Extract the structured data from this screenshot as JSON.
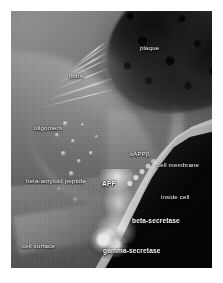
{
  "figure": {
    "kind": "scientific-illustration",
    "color_mode": "grayscale",
    "border_color": "#ffffff",
    "label_color": "#f4f4f4",
    "labels": [
      {
        "id": "plaque",
        "text": "plaque",
        "x": 140,
        "y": 44,
        "bold": false
      },
      {
        "id": "fibrils",
        "text": "fibrils",
        "x": 69,
        "y": 72,
        "bold": false
      },
      {
        "id": "oligomers",
        "text": "oligomers",
        "x": 34,
        "y": 124,
        "bold": false
      },
      {
        "id": "sappb",
        "text": "sAPPβ",
        "x": 130,
        "y": 150,
        "bold": false
      },
      {
        "id": "cell-membrane",
        "text": "cell membrane",
        "x": 157,
        "y": 161,
        "bold": false
      },
      {
        "id": "beta-amyloid-peptide",
        "text": "beta-amyloid peptide",
        "x": 26,
        "y": 177,
        "bold": false
      },
      {
        "id": "app",
        "text": "APP",
        "x": 102,
        "y": 180,
        "bold": true
      },
      {
        "id": "inside-cell",
        "text": "inside cell",
        "x": 161,
        "y": 193,
        "bold": false
      },
      {
        "id": "beta-secretase",
        "text": "beta-secretase",
        "x": 132,
        "y": 217,
        "bold": true
      },
      {
        "id": "cell-surface",
        "text": "cell surface",
        "x": 22,
        "y": 242,
        "bold": false
      },
      {
        "id": "gamma-secretase",
        "text": "gamma-secretase",
        "x": 103,
        "y": 247,
        "bold": true
      }
    ],
    "fibril_strands": [
      {
        "left": 36,
        "top": 88,
        "width": 68,
        "rotate": -18
      },
      {
        "left": 40,
        "top": 80,
        "width": 62,
        "rotate": -22
      },
      {
        "left": 46,
        "top": 72,
        "width": 56,
        "rotate": -26
      },
      {
        "left": 52,
        "top": 66,
        "width": 50,
        "rotate": -30
      },
      {
        "left": 58,
        "top": 60,
        "width": 44,
        "rotate": -34
      },
      {
        "left": 30,
        "top": 96,
        "width": 74,
        "rotate": -14
      },
      {
        "left": 64,
        "top": 54,
        "width": 38,
        "rotate": -38
      }
    ],
    "oligomer_blobs": [
      {
        "left": 52,
        "top": 110,
        "size": 5
      },
      {
        "left": 44,
        "top": 122,
        "size": 4
      },
      {
        "left": 60,
        "top": 128,
        "size": 4
      },
      {
        "left": 50,
        "top": 140,
        "size": 5
      },
      {
        "left": 66,
        "top": 148,
        "size": 4
      },
      {
        "left": 58,
        "top": 160,
        "size": 5
      },
      {
        "left": 72,
        "top": 170,
        "size": 4
      },
      {
        "left": 46,
        "top": 176,
        "size": 4
      },
      {
        "left": 62,
        "top": 186,
        "size": 5
      },
      {
        "left": 78,
        "top": 140,
        "size": 4
      },
      {
        "left": 84,
        "top": 124,
        "size": 3
      },
      {
        "left": 70,
        "top": 112,
        "size": 3
      }
    ]
  }
}
